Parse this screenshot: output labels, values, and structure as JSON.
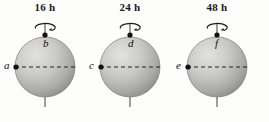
{
  "figure": {
    "background_color": "#fdfdfc",
    "sphere_fill_light": "#d9d9d6",
    "sphere_fill_dark": "#8d8d8a",
    "axis_color": "#3a3a3a",
    "dashed_line_color": "#2a2a2a",
    "dot_color": "#111111"
  },
  "spheres": [
    {
      "period_label": "16 h",
      "pole_point_label": "b",
      "equator_point_label": "a",
      "rotation_icon": "curved-rotation-arrow-icon",
      "axis_icon": "rotation-axis-icon",
      "equator_icon": "dashed-equator-icon",
      "center_x": 45,
      "center_y": 67,
      "radius": 30
    },
    {
      "period_label": "24 h",
      "pole_point_label": "d",
      "equator_point_label": "c",
      "rotation_icon": "curved-rotation-arrow-icon",
      "axis_icon": "rotation-axis-icon",
      "equator_icon": "dashed-equator-icon",
      "center_x": 45,
      "center_y": 67,
      "radius": 30
    },
    {
      "period_label": "48 h",
      "pole_point_label": "f",
      "equator_point_label": "e",
      "rotation_icon": "curved-rotation-arrow-icon",
      "axis_icon": "rotation-axis-icon",
      "equator_icon": "dashed-equator-icon",
      "center_x": 45,
      "center_y": 67,
      "radius": 30
    }
  ]
}
